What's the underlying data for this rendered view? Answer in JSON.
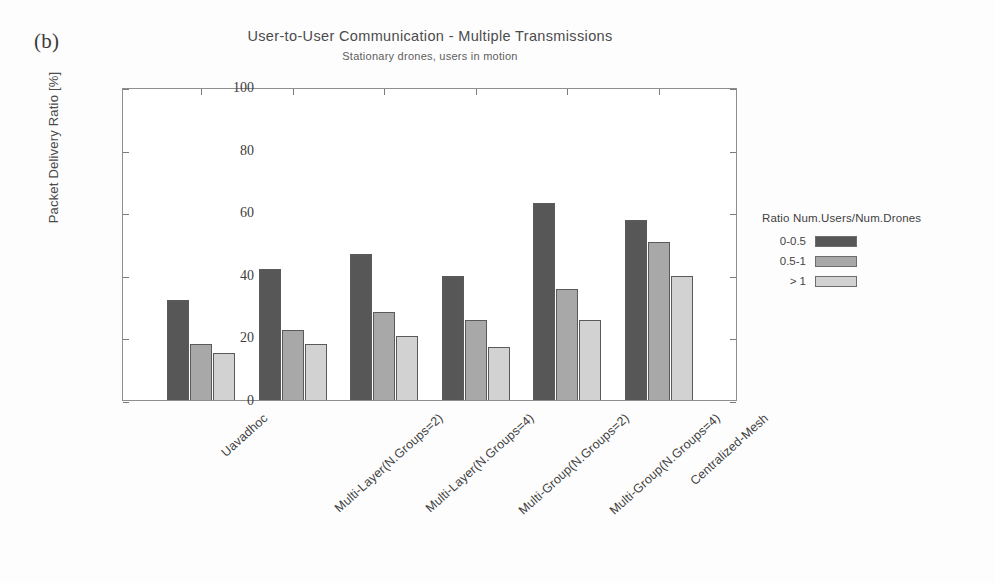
{
  "panel": {
    "label": "(b)"
  },
  "titles": {
    "main": "User-to-User Communication - Multiple Transmissions",
    "sub": "Stationary drones, users in motion"
  },
  "axes": {
    "ylabel": "Packet Delivery Ratio [%]",
    "xlabel": ""
  },
  "legend": {
    "title": "Ratio Num.Users/Num.Drones",
    "entries": [
      {
        "label": "0-0.5",
        "color": "#575757"
      },
      {
        "label": "0.5-1",
        "color": "#a8a8a8"
      },
      {
        "label": "> 1",
        "color": "#d2d2d2"
      }
    ]
  },
  "chart_data": {
    "type": "bar",
    "title": "User-to-User Communication - Multiple Transmissions",
    "subtitle": "Stationary drones, users in motion",
    "xlabel": "",
    "ylabel": "Packet Delivery Ratio [%]",
    "ylim": [
      0,
      100
    ],
    "yticks": [
      0,
      20,
      40,
      60,
      80,
      100
    ],
    "grid": false,
    "legend_position": "right",
    "legend_title": "Ratio Num.Users/Num.Drones",
    "categories": [
      "Uavadhoc",
      "Multi-Layer(N.Groups=2)",
      "Multi-Layer(N.Groups=4)",
      "Multi-Group(N.Groups=2)",
      "Multi-Group(N.Groups=4)",
      "Centralized-Mesh"
    ],
    "series": [
      {
        "name": "0-0.5",
        "color": "#575757",
        "values": [
          32,
          42,
          46.5,
          39.5,
          63,
          57.5
        ]
      },
      {
        "name": "0.5-1",
        "color": "#a8a8a8",
        "values": [
          18,
          22.5,
          28,
          25.5,
          35.5,
          50.5
        ]
      },
      {
        "name": "> 1",
        "color": "#d2d2d2",
        "values": [
          15,
          18,
          20.5,
          17,
          25.5,
          39.5
        ]
      }
    ]
  }
}
